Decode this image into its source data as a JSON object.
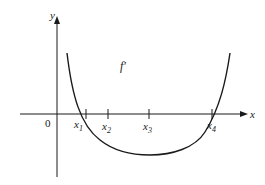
{
  "diagram": {
    "type": "function-graph",
    "axes": {
      "x_label": "x",
      "y_label": "y",
      "origin_label": "0"
    },
    "curve_label": "f′",
    "ticks": [
      {
        "main": "x",
        "sub": "1"
      },
      {
        "main": "x",
        "sub": "2"
      },
      {
        "main": "x",
        "sub": "3"
      },
      {
        "main": "x",
        "sub": "4"
      }
    ],
    "colors": {
      "stroke": "#1a1a1a",
      "background": "#ffffff"
    }
  }
}
